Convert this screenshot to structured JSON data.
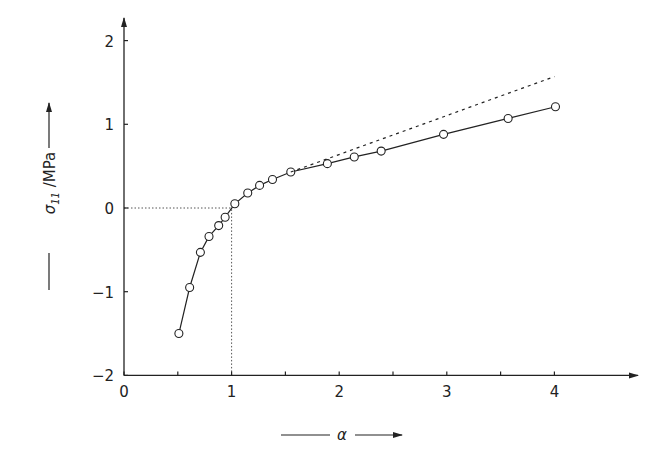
{
  "chart_data": {
    "type": "line",
    "title": "",
    "xlabel": "α",
    "ylabel": "σ11 /MPa",
    "ylabel_main": "σ",
    "ylabel_sub": "11",
    "ylabel_unit": " /MPa",
    "xlim": [
      0,
      4.7
    ],
    "ylim": [
      -2,
      2.3
    ],
    "x_ticks": [
      0,
      1,
      2,
      3,
      4
    ],
    "x_tick_labels": [
      "0",
      "1",
      "2",
      "3",
      "4"
    ],
    "x_minor_ticks": [
      0.5,
      1.5,
      2.5,
      3.5
    ],
    "y_ticks": [
      -2,
      -1,
      0,
      1,
      2
    ],
    "y_tick_labels": [
      "-2",
      "-1",
      "0",
      "1",
      "2"
    ],
    "grid": false,
    "legend": null,
    "series": [
      {
        "name": "measured",
        "style": "solid line with open circle markers",
        "x": [
          0.51,
          0.61,
          0.71,
          0.79,
          0.88,
          0.94,
          1.03,
          1.15,
          1.26,
          1.38,
          1.55,
          1.89,
          2.14,
          2.39,
          2.97,
          3.57,
          4.01
        ],
        "y": [
          -1.5,
          -0.95,
          -0.53,
          -0.34,
          -0.21,
          -0.11,
          0.05,
          0.18,
          0.27,
          0.34,
          0.43,
          0.53,
          0.61,
          0.68,
          0.88,
          1.07,
          1.21
        ]
      },
      {
        "name": "extrapolation",
        "style": "dashed line",
        "x": [
          1.55,
          4.0
        ],
        "y": [
          0.43,
          1.57
        ]
      }
    ],
    "reference_lines": [
      {
        "orientation": "horizontal",
        "y": 0,
        "x_from": 0,
        "x_to": 1,
        "style": "dotted"
      },
      {
        "orientation": "vertical",
        "x": 1,
        "y_from": -2,
        "y_to": 0,
        "style": "dotted"
      }
    ]
  }
}
